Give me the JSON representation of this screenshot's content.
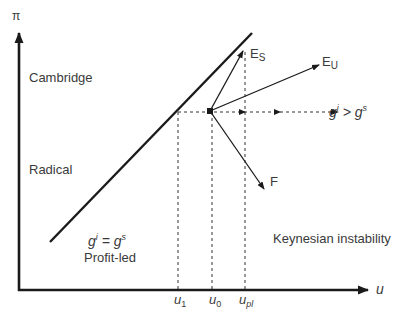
{
  "axes": {
    "y_label": "π",
    "x_label": "u"
  },
  "regions": {
    "cambridge": "Cambridge",
    "radical": "Radical",
    "profit_led": "Profit-led",
    "keynesian": "Keynesian instability"
  },
  "conditions": {
    "equal_g": "g",
    "equal_i": "i",
    "equal_eq": " = g",
    "equal_s": "s",
    "greater_g": "g",
    "greater_i": "i",
    "greater_gt": " > g",
    "greater_s": "s"
  },
  "vectors": {
    "es_main": "E",
    "es_sub": "S",
    "eu_main": "E",
    "eu_sub": "U",
    "f": "F"
  },
  "ticks": {
    "u1_main": "u",
    "u1_sub": "1",
    "u0_main": "u",
    "u0_sub": "0",
    "upl_main": "u",
    "upl_sub": "pl"
  },
  "colors": {
    "line": "#1a1a1a",
    "text": "#3a3a3a"
  }
}
